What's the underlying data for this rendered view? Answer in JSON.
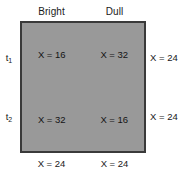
{
  "chart_data": {
    "type": "table",
    "title": "",
    "xlabel": "",
    "ylabel": "",
    "grid": true,
    "legend": null,
    "column_headers": [
      "Bright",
      "Dull"
    ],
    "row_labels": [
      {
        "base": "t",
        "sub": "1"
      },
      {
        "base": "t",
        "sub": "2"
      }
    ],
    "cells": [
      [
        "X = 16",
        "X = 32"
      ],
      [
        "X = 32",
        "X = 16"
      ]
    ],
    "values": [
      [
        16,
        32
      ],
      [
        32,
        16
      ]
    ],
    "row_margins": [
      "X = 24",
      "X = 24"
    ],
    "row_margin_values": [
      24,
      24
    ],
    "column_margins": [
      "X = 24",
      "X = 24"
    ],
    "column_margin_values": [
      24,
      24
    ],
    "colors": {
      "cell_fill": "#999999",
      "border": "#3a3a3a",
      "divider": "#ffffff",
      "text": "#1a1a1a",
      "background": "#ffffff"
    }
  }
}
